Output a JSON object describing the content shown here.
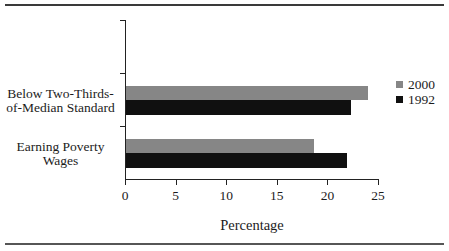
{
  "chart_data": {
    "type": "bar",
    "orientation": "horizontal",
    "title": "",
    "xlabel": "Percentage",
    "xlim": [
      0,
      25
    ],
    "xticks": [
      "0",
      "5",
      "10",
      "15",
      "20",
      "25"
    ],
    "grid": false,
    "legend_position": "right",
    "categories": [
      "Below Two-Thirds-of-Median Standard",
      "Earning Poverty Wages"
    ],
    "series": [
      {
        "name": "2000",
        "color": "#868686",
        "values": [
          23.9,
          18.6
        ]
      },
      {
        "name": "1992",
        "color": "#101010",
        "values": [
          22.2,
          21.8
        ]
      }
    ]
  },
  "labels": {
    "category1_line1": "Below Two-Thirds-",
    "category1_line2": "of-Median Standard",
    "category2_line1": "Earning Poverty",
    "category2_line2": "Wages"
  },
  "legend": {
    "items": [
      {
        "label": "2000",
        "color": "#868686"
      },
      {
        "label": "1992",
        "color": "#101010"
      }
    ]
  },
  "colors": {
    "axis": "#222222",
    "top_rule": "#3a3a3a",
    "bottom_rule": "#565656"
  }
}
